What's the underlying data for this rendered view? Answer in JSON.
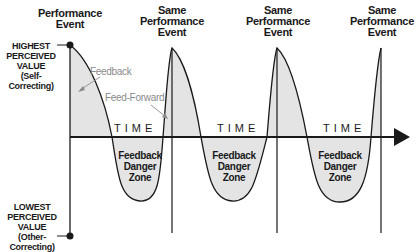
{
  "diagram": {
    "events": [
      {
        "label_line1": "Performance",
        "label_line2": "Event",
        "label_line3": ""
      },
      {
        "label_line1": "Same",
        "label_line2": "Performance",
        "label_line3": "Event"
      },
      {
        "label_line1": "Same",
        "label_line2": "Performance",
        "label_line3": "Event"
      },
      {
        "label_line1": "Same",
        "label_line2": "Performance",
        "label_line3": "Event"
      }
    ],
    "y_axis": {
      "top": {
        "line1": "HIGHEST",
        "line2": "PERCEIVED",
        "line3": "VALUE",
        "line4": "(Self-Correcting)"
      },
      "bottom": {
        "line1": "LOWEST",
        "line2": "PERCEIVED",
        "line3": "VALUE",
        "line4": "(Other-Correcting)"
      }
    },
    "x_axis_label": "TIME",
    "annotations": {
      "feedback": "Feedback",
      "feed_forward": "Feed-Forward"
    },
    "danger_zone": {
      "line1": "Feedback",
      "line2": "Danger",
      "line3": "Zone"
    },
    "colors": {
      "line": "#1a1a1a",
      "fill": "#e4e4e4",
      "annotation": "#8a8a8a"
    }
  }
}
